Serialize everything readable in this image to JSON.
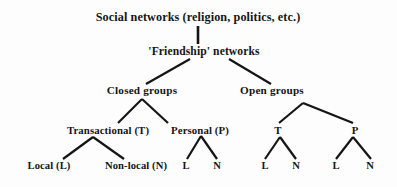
{
  "diagram": {
    "type": "hierarchy-tree",
    "background_color": "#fdfdfd",
    "ink_color": "#151515",
    "nodes": [
      {
        "id": "root",
        "label": "Social networks (religion, politics, etc.)",
        "level": 0,
        "x": 198,
        "y": 17
      },
      {
        "id": "friendship",
        "label": "'Friendship' networks",
        "level": 1,
        "x": 204,
        "y": 52
      },
      {
        "id": "closed",
        "label": "Closed  groups",
        "level": 2,
        "x": 142,
        "y": 91
      },
      {
        "id": "open",
        "label": "Open groups",
        "level": 2,
        "x": 272,
        "y": 91
      },
      {
        "id": "c-trans",
        "label": "Transactional (T)",
        "level": 3,
        "x": 108,
        "y": 130
      },
      {
        "id": "c-pers",
        "label": "Personal (P)",
        "level": 3,
        "x": 200,
        "y": 130
      },
      {
        "id": "o-trans",
        "label": "T",
        "level": 3,
        "x": 278,
        "y": 130
      },
      {
        "id": "o-pers",
        "label": "P",
        "level": 3,
        "x": 355,
        "y": 130
      },
      {
        "id": "ct-local",
        "label": "Local (L)",
        "level": 4,
        "x": 49,
        "y": 166
      },
      {
        "id": "ct-nonlocal",
        "label": "Non-local (N)",
        "level": 4,
        "x": 136,
        "y": 166
      },
      {
        "id": "cp-l",
        "label": "L",
        "level": 4,
        "x": 186,
        "y": 166
      },
      {
        "id": "cp-n",
        "label": "N",
        "level": 4,
        "x": 217,
        "y": 166
      },
      {
        "id": "ot-l",
        "label": "L",
        "level": 4,
        "x": 265,
        "y": 166
      },
      {
        "id": "ot-n",
        "label": "N",
        "level": 4,
        "x": 296,
        "y": 166
      },
      {
        "id": "op-l",
        "label": "L",
        "level": 4,
        "x": 336,
        "y": 166
      },
      {
        "id": "op-n",
        "label": "N",
        "level": 4,
        "x": 370,
        "y": 166
      }
    ],
    "edges": [
      {
        "from": "root",
        "to": "friendship",
        "x1": 198,
        "y1": 26,
        "x2": 198,
        "y2": 44,
        "width": 2.6
      },
      {
        "from": "friendship",
        "to": "closed",
        "x1": 190,
        "y1": 59,
        "x2": 146,
        "y2": 84,
        "width": 2.2
      },
      {
        "from": "friendship",
        "to": "open",
        "x1": 229,
        "y1": 59,
        "x2": 271,
        "y2": 84,
        "width": 2.2
      },
      {
        "from": "closed",
        "to": "c-trans",
        "x1": 142,
        "y1": 99,
        "x2": 118,
        "y2": 123,
        "width": 2.2
      },
      {
        "from": "closed",
        "to": "c-pers",
        "x1": 142,
        "y1": 99,
        "x2": 168,
        "y2": 123,
        "width": 2.2
      },
      {
        "from": "open",
        "to": "o-trans",
        "x1": 303,
        "y1": 103,
        "x2": 279,
        "y2": 123,
        "width": 2.2
      },
      {
        "from": "open",
        "to": "o-pers",
        "x1": 303,
        "y1": 103,
        "x2": 353,
        "y2": 123,
        "width": 2.2
      },
      {
        "from": "c-trans",
        "to": "ct-local",
        "x1": 93,
        "y1": 137,
        "x2": 63,
        "y2": 159,
        "width": 2.2
      },
      {
        "from": "c-trans",
        "to": "ct-nonlocal",
        "x1": 93,
        "y1": 137,
        "x2": 124,
        "y2": 159,
        "width": 2.2
      },
      {
        "from": "c-pers",
        "to": "cp-l",
        "x1": 201,
        "y1": 136,
        "x2": 187,
        "y2": 159,
        "width": 2.2
      },
      {
        "from": "c-pers",
        "to": "cp-n",
        "x1": 201,
        "y1": 136,
        "x2": 217,
        "y2": 159,
        "width": 2.2
      },
      {
        "from": "o-trans",
        "to": "ot-l",
        "x1": 280,
        "y1": 137,
        "x2": 265,
        "y2": 159,
        "width": 2.2
      },
      {
        "from": "o-trans",
        "to": "ot-n",
        "x1": 280,
        "y1": 137,
        "x2": 296,
        "y2": 159,
        "width": 2.2
      },
      {
        "from": "o-pers",
        "to": "op-l",
        "x1": 353,
        "y1": 137,
        "x2": 336,
        "y2": 159,
        "width": 2.2
      },
      {
        "from": "o-pers",
        "to": "op-n",
        "x1": 353,
        "y1": 137,
        "x2": 371,
        "y2": 159,
        "width": 2.2
      }
    ]
  }
}
